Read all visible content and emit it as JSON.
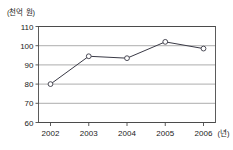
{
  "figure": {
    "cut_off_top_text": "",
    "y_unit_label": "(천억 원)",
    "x_unit_label": "(년)"
  },
  "chart_data": {
    "type": "line",
    "title": "",
    "xlabel": "(년)",
    "ylabel": "(천억 원)",
    "categories": [
      "2002",
      "2003",
      "2004",
      "2005",
      "2006"
    ],
    "values": [
      80,
      94.5,
      93.5,
      102,
      98.5
    ],
    "series": [
      {
        "name": "",
        "values": [
          80,
          94.5,
          93.5,
          102,
          98.5
        ]
      }
    ],
    "ylim": [
      60,
      110
    ],
    "y_ticks": [
      60,
      70,
      80,
      90,
      100,
      110
    ],
    "y_tick_labels": [
      "60",
      "70",
      "80",
      "90",
      "100",
      "110"
    ],
    "x_ticks": [
      "2002",
      "2003",
      "2004",
      "2005",
      "2006"
    ],
    "grid": "horizontal",
    "legend": "none",
    "marker": "open-circle",
    "line_color": "#3a3a46",
    "marker_fill": "#ffffff",
    "grid_color": "#8a8a8a",
    "axis_color": "#4a4a4a"
  }
}
